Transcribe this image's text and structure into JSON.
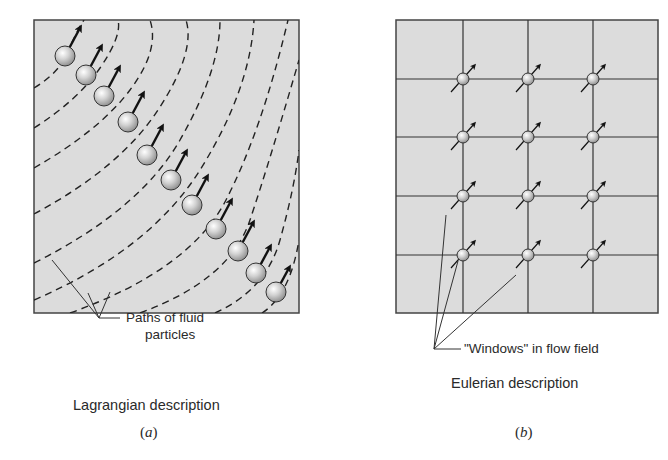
{
  "figure": {
    "panels": [
      {
        "id": "a",
        "sublabel": "a",
        "title": "Lagrangian description",
        "annotation_line1": "Paths of fluid",
        "annotation_line2": "particles",
        "frame": {
          "x": 34,
          "y": 20,
          "w": 265,
          "h": 293
        },
        "fill_color": "#dcdcdc",
        "particle_count": 11,
        "path_count": 9,
        "particles": [
          [
            65,
            56
          ],
          [
            86,
            75
          ],
          [
            104,
            96
          ],
          [
            128,
            122
          ],
          [
            147,
            155
          ],
          [
            171,
            180
          ],
          [
            192,
            205
          ],
          [
            216,
            229
          ],
          [
            238,
            251
          ],
          [
            256,
            273
          ],
          [
            276,
            292
          ]
        ]
      },
      {
        "id": "b",
        "sublabel": "b",
        "title": "Eulerian description",
        "annotation": "\"Windows\" in flow field",
        "frame": {
          "x": 396,
          "y": 20,
          "w": 262,
          "h": 293
        },
        "fill_color": "#dcdcdc",
        "grid_columns_x": [
          463,
          528,
          593
        ],
        "grid_rows_y": [
          79,
          137,
          196,
          255
        ],
        "window_count": 12
      }
    ]
  }
}
